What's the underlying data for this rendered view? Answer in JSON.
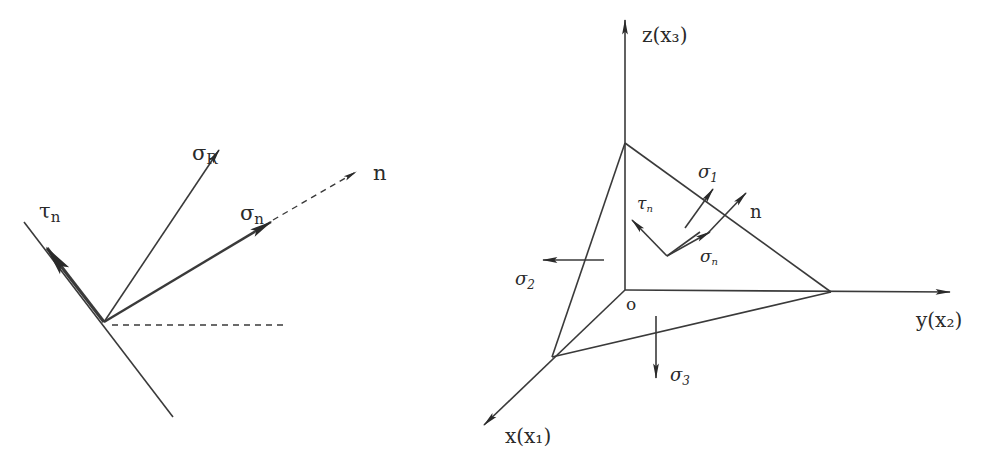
{
  "left_diagram": {
    "title": "Stress vector decomposition on an oblique plane",
    "labels": {
      "tau_n": {
        "base": "τ",
        "sub": "n"
      },
      "sigma_R": {
        "base": "σ",
        "sub": "R"
      },
      "sigma_n": {
        "base": "σ",
        "sub": "n"
      },
      "normal": "n"
    }
  },
  "right_diagram": {
    "title": "Tetrahedron element with principal stresses",
    "axes": {
      "z": "z(x₃)",
      "y": "y(x₂)",
      "x": "x(x₁)"
    },
    "origin": "o",
    "labels": {
      "sigma_1": {
        "base": "σ",
        "sub": "1"
      },
      "sigma_2": {
        "base": "σ",
        "sub": "2"
      },
      "sigma_3": {
        "base": "σ",
        "sub": "3"
      },
      "tau_n": {
        "base": "τ",
        "sub": "n"
      },
      "sigma_n": {
        "base": "σ",
        "sub": "n"
      },
      "normal": "n"
    }
  },
  "colors": {
    "line": "#3a3a3a",
    "text": "#2a2a2a",
    "background": "#ffffff"
  }
}
